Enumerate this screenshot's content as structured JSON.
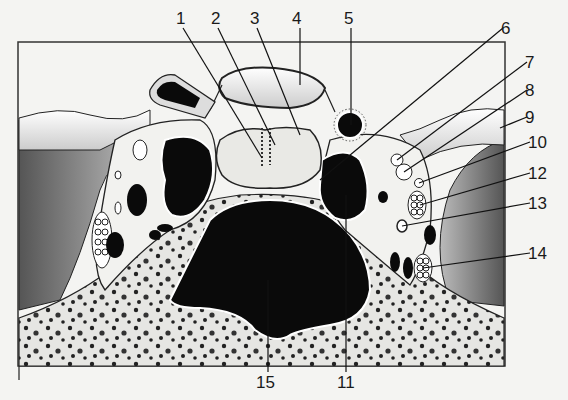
{
  "figure": {
    "type": "anatomical cross-section diagram",
    "labels": [
      {
        "id": "1",
        "text": "1",
        "x": 176,
        "y": 10
      },
      {
        "id": "2",
        "text": "2",
        "x": 211,
        "y": 10
      },
      {
        "id": "3",
        "text": "3",
        "x": 250,
        "y": 10
      },
      {
        "id": "4",
        "text": "4",
        "x": 292,
        "y": 10
      },
      {
        "id": "5",
        "text": "5",
        "x": 344,
        "y": 10
      },
      {
        "id": "6",
        "text": "6",
        "x": 501,
        "y": 20
      },
      {
        "id": "7",
        "text": "7",
        "x": 525,
        "y": 54
      },
      {
        "id": "8",
        "text": "8",
        "x": 525,
        "y": 82
      },
      {
        "id": "9",
        "text": "9",
        "x": 525,
        "y": 109
      },
      {
        "id": "10",
        "text": "10",
        "x": 528,
        "y": 134
      },
      {
        "id": "12",
        "text": "12",
        "x": 528,
        "y": 165
      },
      {
        "id": "13",
        "text": "13",
        "x": 528,
        "y": 195
      },
      {
        "id": "14",
        "text": "14",
        "x": 528,
        "y": 245
      },
      {
        "id": "15",
        "text": "15",
        "x": 256,
        "y": 374
      },
      {
        "id": "11",
        "text": "11",
        "x": 337,
        "y": 374
      }
    ]
  }
}
